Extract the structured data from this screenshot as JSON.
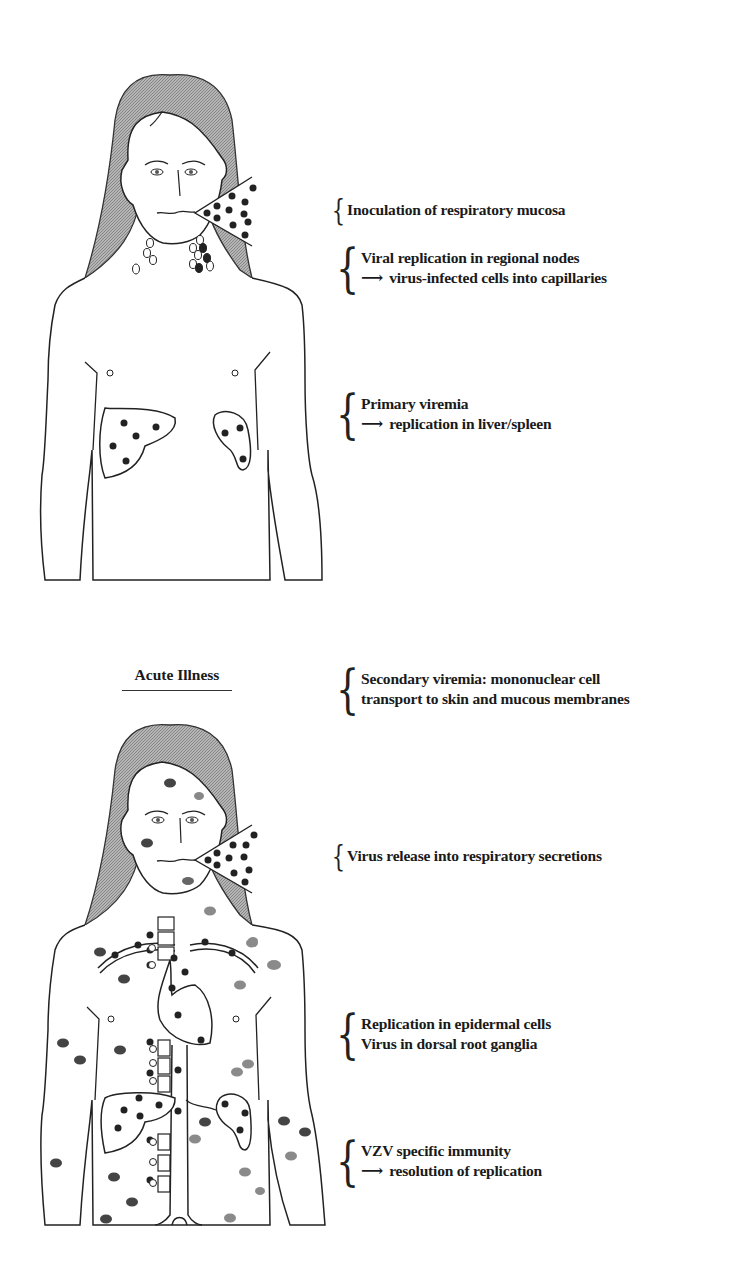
{
  "figure_top": {
    "name": "Incubation period body diagram",
    "annotations": [
      {
        "lines": [
          "Inoculation of respiratory mucosa"
        ],
        "arrow_lines": []
      },
      {
        "lines": [
          "Viral replication in regional nodes",
          "virus-infected cells into capillaries"
        ],
        "arrow_lines": [
          1
        ]
      },
      {
        "lines": [
          "Primary viremia",
          "replication in liver/spleen"
        ],
        "arrow_lines": [
          1
        ]
      }
    ]
  },
  "figure_bottom": {
    "title": "Acute Illness",
    "annotations": [
      {
        "lines": [
          "Secondary viremia: mononuclear cell",
          "transport to skin and mucous membranes"
        ],
        "arrow_lines": []
      },
      {
        "lines": [
          "Virus release into respiratory secretions"
        ],
        "arrow_lines": []
      },
      {
        "lines": [
          "Replication in epidermal cells",
          "Virus in dorsal root ganglia"
        ],
        "arrow_lines": []
      },
      {
        "lines": [
          "VZV specific immunity",
          "resolution of replication"
        ],
        "arrow_lines": [
          1
        ]
      }
    ]
  },
  "arrow_glyph": "⟶",
  "colors": {
    "ink": "#1a1a1a",
    "hair": "#9a9a9a",
    "lesion": "#3a3a3a",
    "lesion_light": "#8a8a8a"
  }
}
